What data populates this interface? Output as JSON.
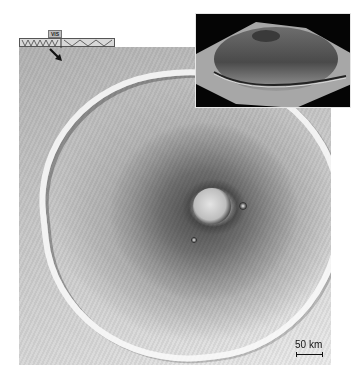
{
  "figure": {
    "main_image": {
      "description": "Grayscale orbital image of a shield volcano with central caldera and surrounding basal scarp"
    },
    "inset": {
      "description": "Oblique perspective view of the volcano on black background"
    },
    "instrument_strip": {
      "label": "VIS",
      "icon": "pointer-arrow-icon"
    },
    "scale_bar": {
      "label": "50 km"
    },
    "colors": {
      "background": "#ffffff",
      "inset_background": "#050505",
      "scale_text": "#111111"
    }
  }
}
